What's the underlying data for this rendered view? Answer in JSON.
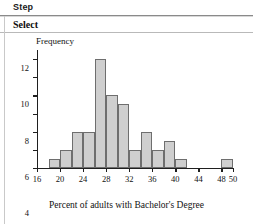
{
  "header": {
    "step_label": "Step",
    "section_label": "Select"
  },
  "chart_data": {
    "type": "bar",
    "title": "",
    "subtitle": "",
    "ylabel": "Frequency",
    "xlabel": "Percent of adults with Bachelor's Degree",
    "xlim": [
      16,
      50
    ],
    "ylim": [
      0,
      13
    ],
    "grid": false,
    "legend": "none",
    "bin_width": 2,
    "x_ticks": [
      16,
      20,
      24,
      28,
      32,
      36,
      40,
      44,
      48,
      50
    ],
    "x_tick_labels": [
      "16",
      "20",
      "24",
      "28",
      "32",
      "36",
      "40",
      "44",
      "48",
      "50"
    ],
    "y_ticks": [
      0,
      2,
      4,
      6,
      8,
      10,
      12
    ],
    "y_tick_labels": [
      "0",
      "2",
      "4",
      "6",
      "8",
      "10",
      "12"
    ],
    "bins": [
      {
        "start": 18,
        "end": 20,
        "value": 1
      },
      {
        "start": 20,
        "end": 22,
        "value": 2
      },
      {
        "start": 22,
        "end": 24,
        "value": 4
      },
      {
        "start": 24,
        "end": 26,
        "value": 4
      },
      {
        "start": 26,
        "end": 28,
        "value": 12
      },
      {
        "start": 28,
        "end": 30,
        "value": 8
      },
      {
        "start": 30,
        "end": 32,
        "value": 7
      },
      {
        "start": 32,
        "end": 34,
        "value": 2
      },
      {
        "start": 34,
        "end": 36,
        "value": 4
      },
      {
        "start": 36,
        "end": 38,
        "value": 2
      },
      {
        "start": 38,
        "end": 40,
        "value": 3
      },
      {
        "start": 40,
        "end": 42,
        "value": 1
      },
      {
        "start": 48,
        "end": 50,
        "value": 1
      }
    ],
    "categories": [
      "18-20",
      "20-22",
      "22-24",
      "24-26",
      "26-28",
      "28-30",
      "30-32",
      "32-34",
      "34-36",
      "36-38",
      "38-40",
      "40-42",
      "48-50"
    ],
    "values": [
      1,
      2,
      4,
      4,
      12,
      8,
      7,
      2,
      4,
      2,
      3,
      1,
      1
    ],
    "colors": {
      "bar_fill": "#cfcfcf",
      "bar_stroke": "#6e6e6e",
      "axis": "#1f1f1f",
      "text": "#111111"
    }
  }
}
